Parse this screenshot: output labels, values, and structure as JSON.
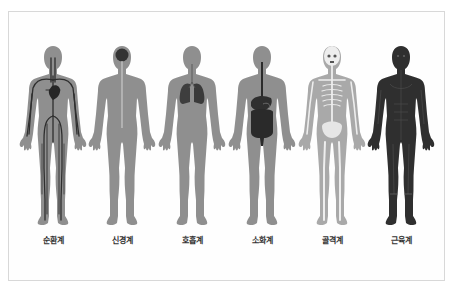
{
  "diagram": {
    "title": "",
    "systems": [
      {
        "id": "circulatory",
        "label": "순환계",
        "body_color": "#8f8f8f",
        "detail_color": "#2e2e2e"
      },
      {
        "id": "nervous",
        "label": "신경계",
        "body_color": "#8f8f8f",
        "detail_color": "#d4d4d4"
      },
      {
        "id": "respiratory",
        "label": "호흡계",
        "body_color": "#8f8f8f",
        "detail_color": "#3a3a3a"
      },
      {
        "id": "digestive",
        "label": "소화계",
        "body_color": "#8f8f8f",
        "detail_color": "#2b2b2b"
      },
      {
        "id": "skeletal",
        "label": "골격계",
        "body_color": "#a9a9a9",
        "detail_color": "#eeeeee"
      },
      {
        "id": "muscular",
        "label": "근육계",
        "body_color": "#2f2f2f",
        "detail_color": "#4a4a4a"
      }
    ]
  },
  "colors": {
    "background": "#ffffff",
    "frame_border": "#d8d8d8",
    "label_text": "#333333"
  }
}
